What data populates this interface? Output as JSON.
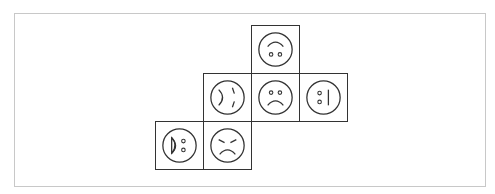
{
  "diagram": {
    "type": "cube-net",
    "cell_size": 48,
    "origin": {
      "x": 155,
      "y": 25
    },
    "stroke_color": "#333333",
    "frame_color": "#c8c8c8",
    "faces": [
      {
        "id": "top",
        "row": 0,
        "col": 2,
        "expression": "upside-down smile (arc above two eyes)",
        "rotation_deg": 180
      },
      {
        "id": "left",
        "row": 1,
        "col": 1,
        "expression": "sideways face with curved mouth on left and slanted brows",
        "rotation_deg": 90
      },
      {
        "id": "center",
        "row": 1,
        "col": 2,
        "expression": "frown",
        "rotation_deg": 0
      },
      {
        "id": "right",
        "row": 1,
        "col": 3,
        "expression": "sideways neutral (two eyes, vertical line mouth)",
        "rotation_deg": 270
      },
      {
        "id": "bottom-left",
        "row": 2,
        "col": 0,
        "expression": "sideways open mouth (half-disc) with two eyes",
        "rotation_deg": 90
      },
      {
        "id": "bottom",
        "row": 2,
        "col": 1,
        "expression": "angry frown with slanted brows",
        "rotation_deg": 0
      }
    ]
  }
}
